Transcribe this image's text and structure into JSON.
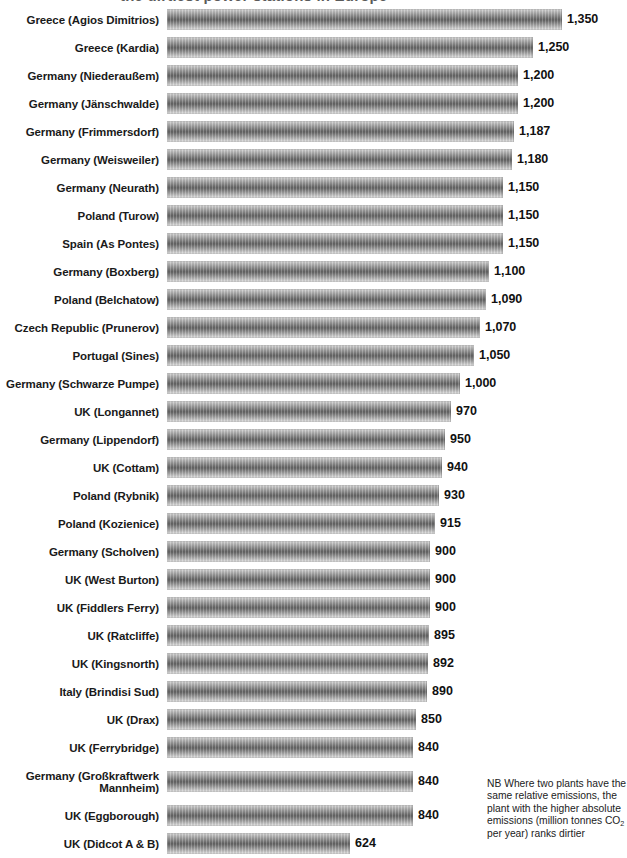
{
  "title_partial": "the dirtiest power stations in Europe",
  "footnote": {
    "line1": "NB Where two plants have the",
    "line2": "same relative emissions, the",
    "line3": "plant with the higher absolute",
    "line4_a": "emissions (million tonnes CO",
    "line4_sub": "2",
    "line5": "per year) ranks dirtier"
  },
  "chart_data": {
    "type": "bar",
    "orientation": "horizontal",
    "title": "",
    "xlabel": "",
    "ylabel": "",
    "xlim": [
      0,
      1350
    ],
    "grid": false,
    "legend": "none",
    "value_format": "comma-separated integers, shown at end of each bar",
    "max_value": 1350,
    "categories": [
      "Greece (Agios Dimitrios)",
      "Greece (Kardia)",
      "Germany (Niederaußem)",
      "Germany (Jänschwalde)",
      "Germany (Frimmersdorf)",
      "Germany (Weisweiler)",
      "Germany (Neurath)",
      "Poland (Turow)",
      "Spain (As Pontes)",
      "Germany (Boxberg)",
      "Poland (Belchatow)",
      "Czech Republic (Prunerov)",
      "Portugal (Sines)",
      "Germany (Schwarze Pumpe)",
      "UK (Longannet)",
      "Germany (Lippendorf)",
      "UK (Cottam)",
      "Poland (Rybnik)",
      "Poland (Kozienice)",
      "Germany (Scholven)",
      "UK (West Burton)",
      "UK (Fiddlers Ferry)",
      "UK (Ratcliffe)",
      "UK (Kingsnorth)",
      "Italy (Brindisi Sud)",
      "UK (Drax)",
      "UK (Ferrybridge)",
      "Germany (Großkraftwerk Mannheim)",
      "UK (Eggborough)",
      "UK (Didcot A & B)"
    ],
    "values": [
      1350,
      1250,
      1200,
      1200,
      1187,
      1180,
      1150,
      1150,
      1150,
      1100,
      1090,
      1070,
      1050,
      1000,
      970,
      950,
      940,
      930,
      915,
      900,
      900,
      900,
      895,
      892,
      890,
      850,
      840,
      840,
      840,
      624
    ],
    "value_labels": [
      "1,350",
      "1,250",
      "1,200",
      "1,200",
      "1,187",
      "1,180",
      "1,150",
      "1,150",
      "1,150",
      "1,100",
      "1,090",
      "1,070",
      "1,050",
      "1,000",
      "970",
      "950",
      "940",
      "930",
      "915",
      "900",
      "900",
      "900",
      "895",
      "892",
      "890",
      "850",
      "840",
      "840",
      "840",
      "624"
    ],
    "bar_color": "#6f6f6f",
    "bar_style": "grey cylindrical gradient with vertical striping"
  }
}
